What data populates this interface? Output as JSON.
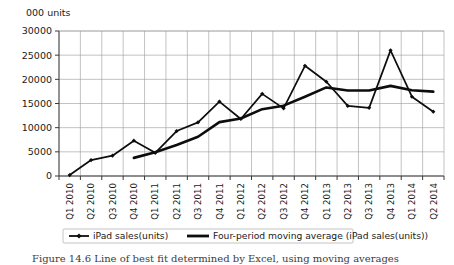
{
  "chart_data": {
    "type": "line",
    "title": "",
    "xlabel": "",
    "ylabel": "000 units",
    "ylim": [
      0,
      30000
    ],
    "ytick_values": [
      0,
      5000,
      10000,
      15000,
      20000,
      25000,
      30000
    ],
    "ytick_labels": [
      "0",
      "5000",
      "10000",
      "15000",
      "20000",
      "25000",
      "30000"
    ],
    "grid": true,
    "legend_position": "bottom",
    "categories": [
      "Q1 2010",
      "Q2 2010",
      "Q3 2010",
      "Q4 2010",
      "Q1 2011",
      "Q2 2011",
      "Q3 2011",
      "Q4 2011",
      "Q1 2012",
      "Q2 2012",
      "Q3 2012",
      "Q4 2012",
      "Q1 2013",
      "Q2 2013",
      "Q3 2013",
      "Q4 2013",
      "Q1 2014",
      "Q2 2014"
    ],
    "series": [
      {
        "name": "iPad sales(units)",
        "marker": "diamond",
        "line_width": 1.7,
        "values": [
          200,
          3300,
          4200,
          7300,
          4800,
          9300,
          11100,
          15400,
          11800,
          17000,
          14000,
          22800,
          19500,
          14500,
          14100,
          26000,
          16400,
          13300
        ]
      },
      {
        "name": "Four-period moving average (iPad sales(units))",
        "marker": "none",
        "line_width": 2.6,
        "values": [
          null,
          null,
          null,
          3750,
          4900,
          6400,
          8125,
          11150,
          11900,
          13825,
          14550,
          16400,
          18325,
          17700,
          17700,
          18650,
          17750,
          17450
        ]
      }
    ]
  },
  "caption": {
    "text": "Figure 14.6 Line of best fit determined by Excel, using moving averages"
  }
}
